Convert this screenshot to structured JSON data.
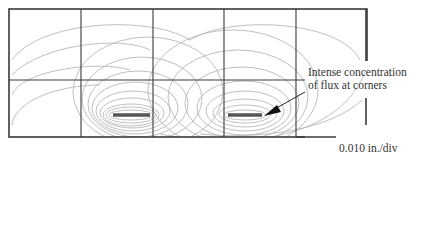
{
  "figure": {
    "annotation": {
      "line1": "Intense concentration",
      "line2": "of flux at corners"
    },
    "scale_label": "0.010 in./div",
    "colors": {
      "grid": "#3a3a3a",
      "flux_lines": "#b5b5b5",
      "conductor": "#555555",
      "text": "#333333"
    },
    "grid": {
      "frame": {
        "x": 9,
        "y": 9,
        "width": 358,
        "height": 128
      },
      "vertical_lines_x": [
        81,
        153,
        224,
        296
      ],
      "horizontal_line_y": 80
    },
    "conductors": [
      {
        "name": "left",
        "x1": 113,
        "x2": 150,
        "y": 115
      },
      {
        "name": "right",
        "x1": 228,
        "x2": 262,
        "y": 115
      }
    ]
  }
}
